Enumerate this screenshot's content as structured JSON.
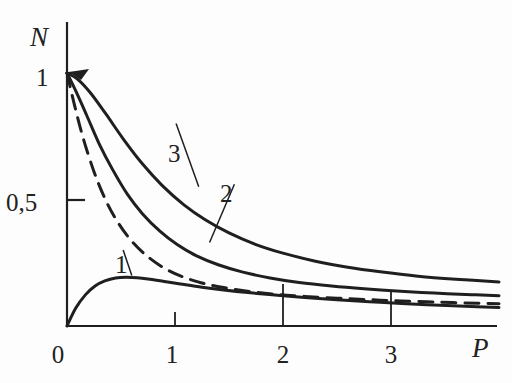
{
  "figure": {
    "background_color": "#fdfdfd",
    "ink_color": "#1f1f1f",
    "axis_label_y": "N",
    "axis_label_x": "P"
  },
  "chart_data": {
    "type": "line",
    "title": "",
    "subtitle": "",
    "xlabel": "P",
    "ylabel": "N",
    "xlim": [
      0,
      4.0
    ],
    "ylim": [
      0,
      1.12
    ],
    "grid": false,
    "legend_position": "inline-annotations",
    "xticks": [
      0,
      1,
      2,
      3
    ],
    "xticklabels": [
      "0",
      "1",
      "2",
      "3"
    ],
    "yticks": [
      0.5,
      1
    ],
    "yticklabels": [
      "0,5",
      "1"
    ],
    "annotations": [
      {
        "text": "1",
        "x": 0.52,
        "y": 0.3,
        "target_x": 0.6,
        "target_y": 0.2
      },
      {
        "text": "2",
        "x": 1.55,
        "y": 0.56,
        "target_x": 1.32,
        "target_y": 0.33
      },
      {
        "text": "3",
        "x": 1.01,
        "y": 0.8,
        "target_x": 1.22,
        "target_y": 0.55
      }
    ],
    "series": [
      {
        "name": "1",
        "style": "solid",
        "x": [
          0.0,
          0.08,
          0.17,
          0.26,
          0.35,
          0.45,
          0.55,
          0.65,
          0.75,
          0.9,
          1.05,
          1.25,
          1.45,
          1.7,
          1.95,
          2.2,
          2.5,
          2.8,
          3.1,
          3.45,
          3.8,
          4.0
        ],
        "y": [
          0.0,
          0.07,
          0.123,
          0.158,
          0.178,
          0.19,
          0.193,
          0.191,
          0.186,
          0.176,
          0.166,
          0.153,
          0.142,
          0.131,
          0.122,
          0.113,
          0.104,
          0.096,
          0.089,
          0.082,
          0.076,
          0.073
        ]
      },
      {
        "name": "2",
        "style": "dashed",
        "x": [
          0.0,
          0.07,
          0.15,
          0.25,
          0.35,
          0.45,
          0.58,
          0.72,
          0.88,
          1.05,
          1.25,
          1.45,
          1.7,
          1.95,
          2.2,
          2.5,
          2.8,
          3.1,
          3.45,
          3.8,
          4.0
        ],
        "y": [
          1.0,
          0.872,
          0.742,
          0.61,
          0.505,
          0.424,
          0.345,
          0.284,
          0.234,
          0.198,
          0.17,
          0.152,
          0.136,
          0.125,
          0.117,
          0.11,
          0.104,
          0.099,
          0.094,
          0.09,
          0.088
        ]
      },
      {
        "name": "2-solid",
        "style": "solid",
        "x": [
          0.0,
          0.08,
          0.18,
          0.3,
          0.42,
          0.56,
          0.7,
          0.86,
          1.02,
          1.2,
          1.4,
          1.62,
          1.88,
          2.15,
          2.45,
          2.75,
          3.05,
          3.4,
          3.75,
          4.0
        ],
        "y": [
          1.0,
          0.93,
          0.835,
          0.718,
          0.62,
          0.52,
          0.443,
          0.375,
          0.322,
          0.277,
          0.242,
          0.214,
          0.19,
          0.172,
          0.158,
          0.147,
          0.138,
          0.13,
          0.124,
          0.12
        ]
      },
      {
        "name": "3",
        "style": "solid",
        "x": [
          0.0,
          0.1,
          0.22,
          0.36,
          0.52,
          0.7,
          0.88,
          1.08,
          1.28,
          1.5,
          1.75,
          2.0,
          2.3,
          2.6,
          2.9,
          3.25,
          3.6,
          4.0
        ],
        "y": [
          1.0,
          0.975,
          0.92,
          0.838,
          0.74,
          0.64,
          0.556,
          0.48,
          0.42,
          0.368,
          0.322,
          0.288,
          0.256,
          0.232,
          0.214,
          0.197,
          0.185,
          0.174
        ]
      }
    ]
  }
}
